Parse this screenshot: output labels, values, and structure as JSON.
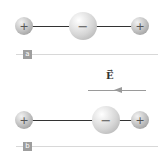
{
  "panels": [
    {
      "label": "a",
      "charges": [
        {
          "sign": "+",
          "size": "small"
        },
        {
          "sign": "−",
          "size": "large"
        },
        {
          "sign": "+",
          "size": "small"
        }
      ]
    },
    {
      "label": "b",
      "charges": [
        {
          "sign": "+",
          "size": "small"
        },
        {
          "sign": "−",
          "size": "large"
        },
        {
          "sign": "+",
          "size": "small"
        }
      ]
    }
  ],
  "field": {
    "symbol": "E",
    "vector_mark": "→",
    "direction": "left"
  },
  "colors": {
    "rod": "#333333",
    "field_arrow": "#9a9a9a",
    "label_bg": "#9e9e9e",
    "separator": "#d8d8d8"
  }
}
